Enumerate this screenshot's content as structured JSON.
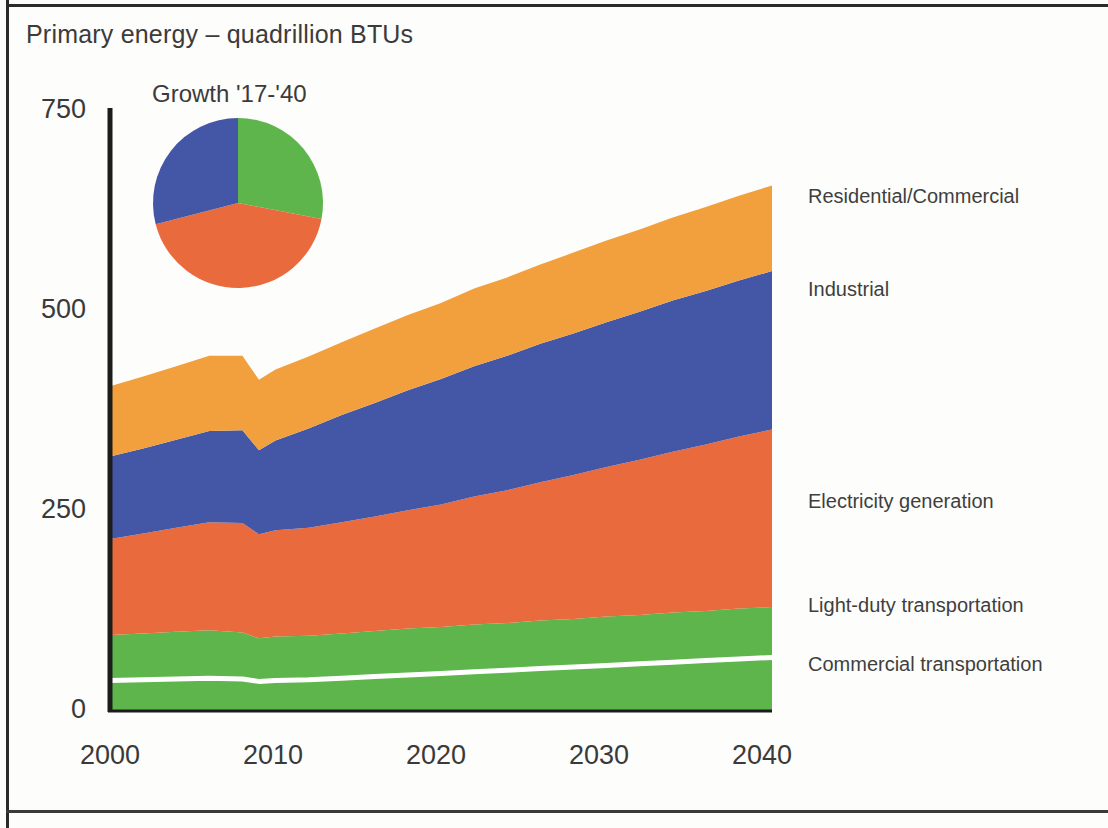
{
  "figure": {
    "title": "Primary energy – quadrillion BTUs",
    "pie_title": "Growth '17-'40"
  },
  "colors": {
    "residential_commercial": "#F2A03D",
    "industrial": "#4456A6",
    "electricity_generation": "#E96A3C",
    "light_duty_transportation": "#5DB54C",
    "commercial_transportation": "#5DB54C",
    "divider_line": "#FFFFFF",
    "axis": "#1c1c1c",
    "text": "#3b3b3b"
  },
  "axes": {
    "y_ticks": [
      "0",
      "250",
      "500",
      "750"
    ],
    "x_ticks": [
      "2000",
      "2010",
      "2020",
      "2030",
      "2040"
    ]
  },
  "legend": {
    "items": [
      {
        "label": "Residential/Commercial",
        "color": "#F2A03D"
      },
      {
        "label": "Industrial",
        "color": "#4456A6"
      },
      {
        "label": "Electricity generation",
        "color": "#E96A3C"
      },
      {
        "label": "Light-duty transportation",
        "color": "#5DB54C"
      },
      {
        "label": "Commercial transportation",
        "color": "#5DB54C"
      }
    ]
  },
  "chart_data": {
    "type": "area",
    "title": "Primary energy – quadrillion BTUs",
    "subtitle": "",
    "xlabel": "",
    "ylabel": "Primary energy – quadrillion BTUs",
    "xlim": [
      2000,
      2040
    ],
    "ylim": [
      0,
      750
    ],
    "yticks": [
      0,
      250,
      500,
      750
    ],
    "xticks": [
      2000,
      2010,
      2020,
      2030,
      2040
    ],
    "grid": false,
    "legend_position": "right-inline",
    "stacked": true,
    "stack_order_bottom_to_top": [
      "Commercial transportation",
      "Light-duty transportation",
      "Electricity generation",
      "Industrial",
      "Residential/Commercial"
    ],
    "x": [
      2000,
      2002,
      2004,
      2006,
      2008,
      2009,
      2010,
      2012,
      2014,
      2016,
      2018,
      2020,
      2022,
      2024,
      2026,
      2028,
      2030,
      2032,
      2034,
      2036,
      2038,
      2040
    ],
    "series": [
      {
        "name": "Commercial transportation",
        "color": "#5DB54C",
        "values": [
          38,
          39,
          40,
          41,
          40,
          37,
          38,
          39,
          41,
          43,
          45,
          47,
          49,
          51,
          53,
          55,
          57,
          59,
          61,
          63,
          65,
          67
        ]
      },
      {
        "name": "Light-duty transportation",
        "color": "#5DB54C",
        "values": [
          57,
          58,
          59,
          60,
          58,
          54,
          55,
          55,
          56,
          57,
          58,
          58,
          59,
          59,
          60,
          60,
          61,
          61,
          62,
          62,
          63,
          63
        ]
      },
      {
        "name": "Electricity generation",
        "color": "#E96A3C",
        "values": [
          120,
          125,
          130,
          135,
          137,
          130,
          133,
          135,
          139,
          143,
          148,
          153,
          160,
          166,
          173,
          180,
          187,
          194,
          201,
          208,
          215,
          222
        ]
      },
      {
        "name": "Industrial",
        "color": "#4456A6",
        "values": [
          103,
          106,
          110,
          114,
          116,
          105,
          112,
          124,
          134,
          142,
          150,
          157,
          163,
          168,
          173,
          177,
          181,
          185,
          189,
          192,
          195,
          198
        ]
      },
      {
        "name": "Residential/Commercial",
        "color": "#F2A03D",
        "values": [
          88,
          90,
          92,
          94,
          93,
          88,
          89,
          90,
          91,
          93,
          94,
          95,
          97,
          98,
          99,
          101,
          102,
          103,
          104,
          105,
          106,
          107
        ]
      }
    ],
    "totals": [
      406,
      418,
      431,
      444,
      444,
      414,
      427,
      443,
      461,
      478,
      495,
      510,
      528,
      542,
      558,
      573,
      588,
      602,
      617,
      630,
      644,
      657
    ]
  },
  "pie_data": {
    "type": "pie",
    "title": "Growth '17-'40",
    "labels": [
      "Transportation",
      "Electricity generation",
      "Industrial"
    ],
    "colors": [
      "#5DB54C",
      "#E96A3C",
      "#4456A6"
    ],
    "values": [
      28,
      43,
      29
    ],
    "start_angle_deg": 0
  }
}
